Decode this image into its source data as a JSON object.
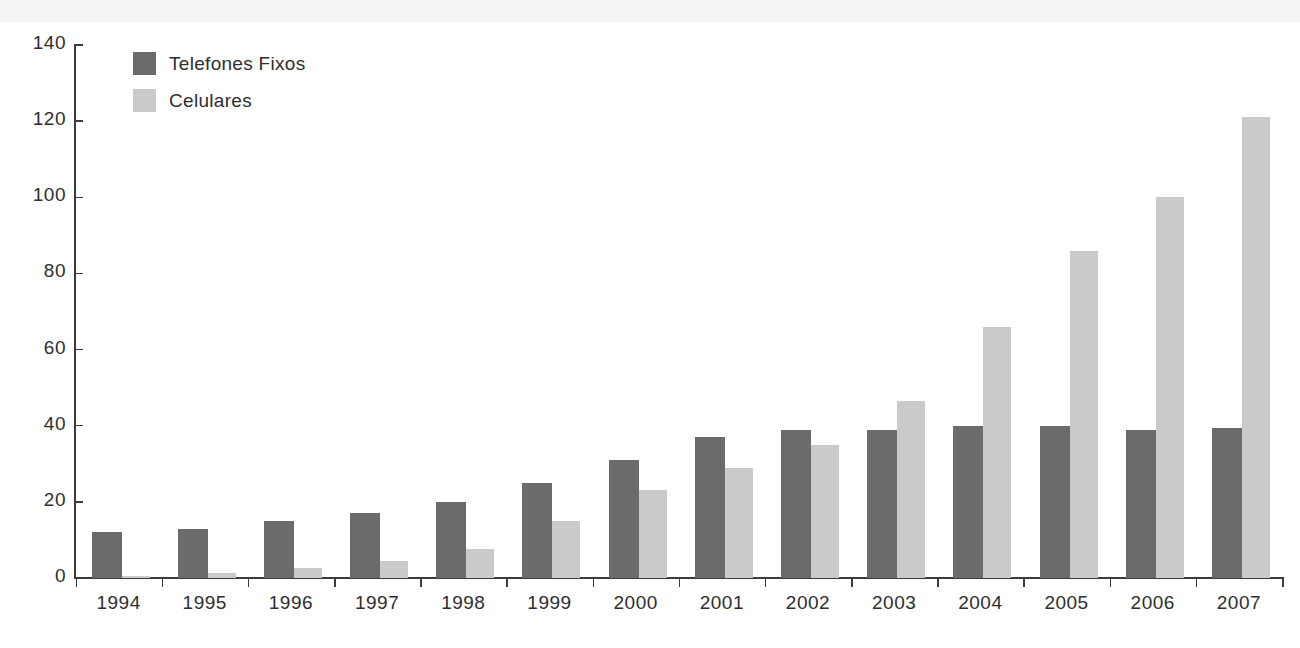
{
  "chart_data": {
    "type": "bar",
    "title": "",
    "subtitle": "",
    "xlabel": "",
    "ylabel": "",
    "ylim": [
      0,
      140
    ],
    "yticks": [
      0,
      20,
      40,
      60,
      80,
      100,
      120,
      140
    ],
    "grid": false,
    "legend_position": "top-left",
    "categories": [
      "1994",
      "1995",
      "1996",
      "1997",
      "1998",
      "1999",
      "2000",
      "2001",
      "2002",
      "2003",
      "2004",
      "2005",
      "2006",
      "2007"
    ],
    "series": [
      {
        "name": "Telefones Fixos",
        "color": "#6b6b6b",
        "values": [
          12,
          13,
          15,
          17,
          20,
          25,
          31,
          37,
          39,
          39,
          40,
          40,
          39,
          39.5
        ]
      },
      {
        "name": "Celulares",
        "color": "#cacaca",
        "values": [
          0.5,
          1.2,
          2.5,
          4.5,
          7.5,
          15,
          23,
          29,
          35,
          46.5,
          66,
          86,
          100,
          121
        ]
      }
    ]
  },
  "axes": {
    "y_tick_labels": [
      "0",
      "20",
      "40",
      "60",
      "80",
      "100",
      "120",
      "140"
    ],
    "x_tick_labels": [
      "1994",
      "1995",
      "1996",
      "1997",
      "1998",
      "1999",
      "2000",
      "2001",
      "2002",
      "2003",
      "2004",
      "2005",
      "2006",
      "2007"
    ]
  },
  "legend": {
    "items": [
      {
        "label": "Telefones Fixos",
        "color": "#6b6b6b"
      },
      {
        "label": "Celulares",
        "color": "#cacaca"
      }
    ]
  },
  "colors": {
    "axis": "#3c3c3c",
    "text": "#2e2e2e",
    "background": "#ffffff",
    "top_band": "#f4f4f5"
  }
}
